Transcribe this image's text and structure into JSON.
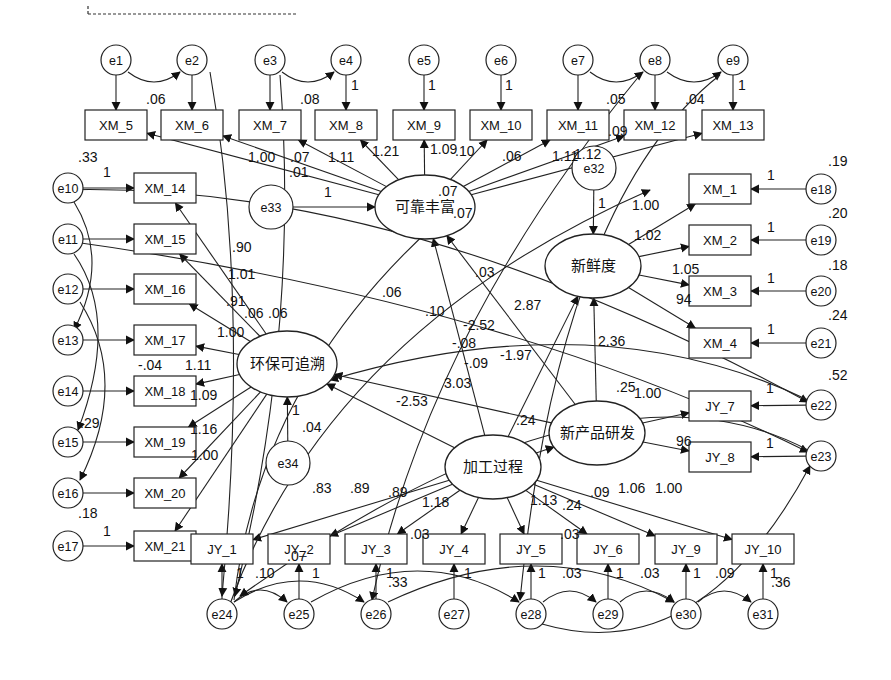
{
  "diagram": {
    "type": "structural-equation-model",
    "latent_variables": [
      {
        "id": "L1",
        "label": "可靠丰富",
        "x": 425,
        "y": 207,
        "rx": 50,
        "ry": 32
      },
      {
        "id": "L2",
        "label": "新鲜度",
        "x": 593,
        "y": 266,
        "rx": 48,
        "ry": 32
      },
      {
        "id": "L3",
        "label": "环保可追溯",
        "x": 287,
        "y": 364,
        "rx": 50,
        "ry": 33
      },
      {
        "id": "L4",
        "label": "新产品研发",
        "x": 597,
        "y": 433,
        "rx": 48,
        "ry": 32
      },
      {
        "id": "L5",
        "label": "加工过程",
        "x": 493,
        "y": 467,
        "rx": 48,
        "ry": 32
      }
    ],
    "observed_variables": [
      {
        "id": "XM_5",
        "label": "XM_5",
        "x": 116,
        "y": 125
      },
      {
        "id": "XM_6",
        "label": "XM_6",
        "x": 192,
        "y": 125
      },
      {
        "id": "XM_7",
        "label": "XM_7",
        "x": 270,
        "y": 125
      },
      {
        "id": "XM_8",
        "label": "XM_8",
        "x": 346,
        "y": 125
      },
      {
        "id": "XM_9",
        "label": "XM_9",
        "x": 424,
        "y": 125
      },
      {
        "id": "XM_10",
        "label": "XM_10",
        "x": 501,
        "y": 125
      },
      {
        "id": "XM_11",
        "label": "XM_11",
        "x": 578,
        "y": 125
      },
      {
        "id": "XM_12",
        "label": "XM_12",
        "x": 655,
        "y": 125
      },
      {
        "id": "XM_13",
        "label": "XM_13",
        "x": 733,
        "y": 125
      },
      {
        "id": "XM_14",
        "label": "XM_14",
        "x": 165,
        "y": 188
      },
      {
        "id": "XM_15",
        "label": "XM_15",
        "x": 165,
        "y": 239
      },
      {
        "id": "XM_16",
        "label": "XM_16",
        "x": 165,
        "y": 289
      },
      {
        "id": "XM_17",
        "label": "XM_17",
        "x": 165,
        "y": 340
      },
      {
        "id": "XM_18",
        "label": "XM_18",
        "x": 165,
        "y": 391
      },
      {
        "id": "XM_19",
        "label": "XM_19",
        "x": 165,
        "y": 442
      },
      {
        "id": "XM_20",
        "label": "XM_20",
        "x": 165,
        "y": 493
      },
      {
        "id": "XM_21",
        "label": "XM_21",
        "x": 165,
        "y": 546
      },
      {
        "id": "XM_1",
        "label": "XM_1",
        "x": 720,
        "y": 189
      },
      {
        "id": "XM_2",
        "label": "XM_2",
        "x": 720,
        "y": 240
      },
      {
        "id": "XM_3",
        "label": "XM_3",
        "x": 720,
        "y": 291
      },
      {
        "id": "XM_4",
        "label": "XM_4",
        "x": 720,
        "y": 343
      },
      {
        "id": "JY_7",
        "label": "JY_7",
        "x": 720,
        "y": 406
      },
      {
        "id": "JY_8",
        "label": "JY_8",
        "x": 720,
        "y": 457
      },
      {
        "id": "JY_1",
        "label": "JY_1",
        "x": 222,
        "y": 549
      },
      {
        "id": "JY_2",
        "label": "JY_2",
        "x": 299,
        "y": 549
      },
      {
        "id": "JY_3",
        "label": "JY_3",
        "x": 376,
        "y": 549
      },
      {
        "id": "JY_4",
        "label": "JY_4",
        "x": 454,
        "y": 549
      },
      {
        "id": "JY_5",
        "label": "JY_5",
        "x": 531,
        "y": 549
      },
      {
        "id": "JY_6",
        "label": "JY_6",
        "x": 608,
        "y": 549
      },
      {
        "id": "JY_9",
        "label": "JY_9",
        "x": 686,
        "y": 549
      },
      {
        "id": "JY_10",
        "label": "JY_10",
        "x": 763,
        "y": 549
      }
    ],
    "error_terms": [
      {
        "id": "e1",
        "label": "e1",
        "x": 116,
        "y": 60,
        "r": 15
      },
      {
        "id": "e2",
        "label": "e2",
        "x": 192,
        "y": 60,
        "r": 15
      },
      {
        "id": "e3",
        "label": "e3",
        "x": 270,
        "y": 60,
        "r": 15
      },
      {
        "id": "e4",
        "label": "e4",
        "x": 346,
        "y": 60,
        "r": 15
      },
      {
        "id": "e5",
        "label": "e5",
        "x": 424,
        "y": 60,
        "r": 15
      },
      {
        "id": "e6",
        "label": "e6",
        "x": 501,
        "y": 60,
        "r": 15
      },
      {
        "id": "e7",
        "label": "e7",
        "x": 578,
        "y": 60,
        "r": 15
      },
      {
        "id": "e8",
        "label": "e8",
        "x": 655,
        "y": 60,
        "r": 15
      },
      {
        "id": "e9",
        "label": "e9",
        "x": 733,
        "y": 60,
        "r": 15
      },
      {
        "id": "e10",
        "label": "e10",
        "x": 68,
        "y": 188,
        "r": 15
      },
      {
        "id": "e11",
        "label": "e11",
        "x": 68,
        "y": 239,
        "r": 15
      },
      {
        "id": "e12",
        "label": "e12",
        "x": 68,
        "y": 289,
        "r": 15
      },
      {
        "id": "e13",
        "label": "e13",
        "x": 68,
        "y": 340,
        "r": 15
      },
      {
        "id": "e14",
        "label": "e14",
        "x": 68,
        "y": 391,
        "r": 15
      },
      {
        "id": "e15",
        "label": "e15",
        "x": 68,
        "y": 442,
        "r": 15
      },
      {
        "id": "e16",
        "label": "e16",
        "x": 68,
        "y": 493,
        "r": 15
      },
      {
        "id": "e17",
        "label": "e17",
        "x": 68,
        "y": 546,
        "r": 15
      },
      {
        "id": "e18",
        "label": "e18",
        "x": 821,
        "y": 189,
        "r": 15
      },
      {
        "id": "e19",
        "label": "e19",
        "x": 821,
        "y": 240,
        "r": 15
      },
      {
        "id": "e20",
        "label": "e20",
        "x": 821,
        "y": 291,
        "r": 15
      },
      {
        "id": "e21",
        "label": "e21",
        "x": 821,
        "y": 343,
        "r": 15
      },
      {
        "id": "e22",
        "label": "e22",
        "x": 821,
        "y": 405,
        "r": 15
      },
      {
        "id": "e23",
        "label": "e23",
        "x": 821,
        "y": 456,
        "r": 15
      },
      {
        "id": "e24",
        "label": "e24",
        "x": 222,
        "y": 614,
        "r": 15
      },
      {
        "id": "e25",
        "label": "e25",
        "x": 299,
        "y": 614,
        "r": 15
      },
      {
        "id": "e26",
        "label": "e26",
        "x": 376,
        "y": 614,
        "r": 15
      },
      {
        "id": "e27",
        "label": "e27",
        "x": 454,
        "y": 614,
        "r": 15
      },
      {
        "id": "e28",
        "label": "e28",
        "x": 531,
        "y": 614,
        "r": 15
      },
      {
        "id": "e29",
        "label": "e29",
        "x": 608,
        "y": 614,
        "r": 15
      },
      {
        "id": "e30",
        "label": "e30",
        "x": 686,
        "y": 614,
        "r": 15
      },
      {
        "id": "e31",
        "label": "e31",
        "x": 763,
        "y": 614,
        "r": 15
      },
      {
        "id": "e32",
        "label": "e32",
        "x": 594,
        "y": 168,
        "r": 22
      },
      {
        "id": "e33",
        "label": "e33",
        "x": 271,
        "y": 207,
        "r": 22
      },
      {
        "id": "e34",
        "label": "e34",
        "x": 288,
        "y": 463,
        "r": 22
      }
    ],
    "coefficient_labels": [
      {
        "text": ".06",
        "x": 146,
        "y": 104
      },
      {
        "text": ".08",
        "x": 300,
        "y": 104
      },
      {
        "text": "1",
        "x": 351,
        "y": 90
      },
      {
        "text": "1",
        "x": 428,
        "y": 90
      },
      {
        "text": "1",
        "x": 505,
        "y": 90
      },
      {
        "text": ".05",
        "x": 606,
        "y": 104
      },
      {
        "text": ".04",
        "x": 685,
        "y": 104
      },
      {
        "text": "1",
        "x": 738,
        "y": 90
      },
      {
        "text": ".33",
        "x": 78,
        "y": 162
      },
      {
        "text": "1.00",
        "x": 248,
        "y": 162
      },
      {
        "text": ".07",
        "x": 290,
        "y": 162
      },
      {
        "text": ".01",
        "x": 289,
        "y": 177
      },
      {
        "text": "1.11",
        "x": 328,
        "y": 162
      },
      {
        "text": "1.21",
        "x": 372,
        "y": 156
      },
      {
        "text": "1.09",
        "x": 430,
        "y": 154
      },
      {
        "text": ".10",
        "x": 455,
        "y": 156
      },
      {
        "text": ".06",
        "x": 502,
        "y": 161
      },
      {
        "text": "1.11",
        "x": 552,
        "y": 161
      },
      {
        "text": "1.12",
        "x": 574,
        "y": 159
      },
      {
        "text": ".09",
        "x": 608,
        "y": 136
      },
      {
        "text": "1",
        "x": 324,
        "y": 197
      },
      {
        "text": ".07",
        "x": 438,
        "y": 196
      },
      {
        "text": ".07",
        "x": 453,
        "y": 218
      },
      {
        "text": "1",
        "x": 598,
        "y": 208
      },
      {
        "text": ".19",
        "x": 828,
        "y": 166
      },
      {
        "text": "1",
        "x": 767,
        "y": 180
      },
      {
        "text": "1.00",
        "x": 632,
        "y": 210
      },
      {
        "text": ".20",
        "x": 828,
        "y": 218
      },
      {
        "text": "1",
        "x": 767,
        "y": 232
      },
      {
        "text": "1.02",
        "x": 634,
        "y": 240
      },
      {
        "text": ".18",
        "x": 828,
        "y": 270
      },
      {
        "text": "1",
        "x": 767,
        "y": 283
      },
      {
        "text": "1.05",
        "x": 672,
        "y": 274
      },
      {
        "text": "94",
        "x": 676,
        "y": 304
      },
      {
        "text": ".24",
        "x": 828,
        "y": 320
      },
      {
        "text": "1",
        "x": 767,
        "y": 334
      },
      {
        "text": "1",
        "x": 103,
        "y": 177
      },
      {
        "text": ".90",
        "x": 232,
        "y": 252
      },
      {
        "text": "1.01",
        "x": 228,
        "y": 279
      },
      {
        "text": ".91",
        "x": 226,
        "y": 306
      },
      {
        "text": ".06",
        "x": 244,
        "y": 318
      },
      {
        "text": ".06",
        "x": 268,
        "y": 318
      },
      {
        "text": "1.00",
        "x": 217,
        "y": 337
      },
      {
        "text": "-.04",
        "x": 138,
        "y": 370
      },
      {
        "text": "1.11",
        "x": 185,
        "y": 370
      },
      {
        "text": "1.09",
        "x": 190,
        "y": 400
      },
      {
        "text": "1.16",
        "x": 190,
        "y": 434
      },
      {
        "text": "1.00",
        "x": 191,
        "y": 460
      },
      {
        "text": ".29",
        "x": 80,
        "y": 428
      },
      {
        "text": ".18",
        "x": 78,
        "y": 518
      },
      {
        "text": "1",
        "x": 103,
        "y": 536
      },
      {
        "text": "1",
        "x": 292,
        "y": 415
      },
      {
        "text": ".04",
        "x": 302,
        "y": 432
      },
      {
        "text": ".06",
        "x": 382,
        "y": 297
      },
      {
        "text": ".03",
        "x": 475,
        "y": 277
      },
      {
        "text": ".10",
        "x": 425,
        "y": 316
      },
      {
        "text": "2.87",
        "x": 514,
        "y": 310
      },
      {
        "text": "-2.52",
        "x": 463,
        "y": 330
      },
      {
        "text": "-.08",
        "x": 452,
        "y": 348
      },
      {
        "text": "2.36",
        "x": 598,
        "y": 346
      },
      {
        "text": "-.09",
        "x": 464,
        "y": 368
      },
      {
        "text": "-1.97",
        "x": 500,
        "y": 360
      },
      {
        "text": "3.03",
        "x": 444,
        "y": 388
      },
      {
        "text": "-2.53",
        "x": 396,
        "y": 406
      },
      {
        "text": ".24",
        "x": 516,
        "y": 425
      },
      {
        "text": ".25",
        "x": 616,
        "y": 392
      },
      {
        "text": "1.00",
        "x": 634,
        "y": 398
      },
      {
        "text": "96",
        "x": 676,
        "y": 446
      },
      {
        "text": ".52",
        "x": 828,
        "y": 380
      },
      {
        "text": "1",
        "x": 766,
        "y": 393
      },
      {
        "text": "1",
        "x": 766,
        "y": 448
      },
      {
        "text": ".83",
        "x": 312,
        "y": 493
      },
      {
        "text": ".89",
        "x": 350,
        "y": 493
      },
      {
        "text": ".89",
        "x": 388,
        "y": 497
      },
      {
        "text": "1.18",
        "x": 422,
        "y": 507
      },
      {
        "text": "1.13",
        "x": 530,
        "y": 505
      },
      {
        "text": ".24",
        "x": 562,
        "y": 510
      },
      {
        "text": ".09",
        "x": 590,
        "y": 497
      },
      {
        "text": "1.06",
        "x": 618,
        "y": 493
      },
      {
        "text": "1.00",
        "x": 655,
        "y": 493
      },
      {
        "text": ".03",
        "x": 410,
        "y": 539
      },
      {
        "text": ".07",
        "x": 287,
        "y": 561
      },
      {
        "text": ".03",
        "x": 560,
        "y": 539
      },
      {
        "text": ".10",
        "x": 255,
        "y": 578
      },
      {
        "text": ".33",
        "x": 388,
        "y": 587
      },
      {
        "text": ".03",
        "x": 562,
        "y": 578
      },
      {
        "text": ".03",
        "x": 640,
        "y": 578
      },
      {
        "text": ".09",
        "x": 715,
        "y": 578
      },
      {
        "text": ".36",
        "x": 771,
        "y": 587
      },
      {
        "text": "1",
        "x": 236,
        "y": 578
      },
      {
        "text": "1",
        "x": 312,
        "y": 578
      },
      {
        "text": "1",
        "x": 386,
        "y": 578
      },
      {
        "text": "1",
        "x": 464,
        "y": 578
      },
      {
        "text": "1",
        "x": 538,
        "y": 578
      },
      {
        "text": "1",
        "x": 616,
        "y": 578
      },
      {
        "text": "1",
        "x": 693,
        "y": 578
      },
      {
        "text": "1",
        "x": 770,
        "y": 578
      }
    ]
  }
}
